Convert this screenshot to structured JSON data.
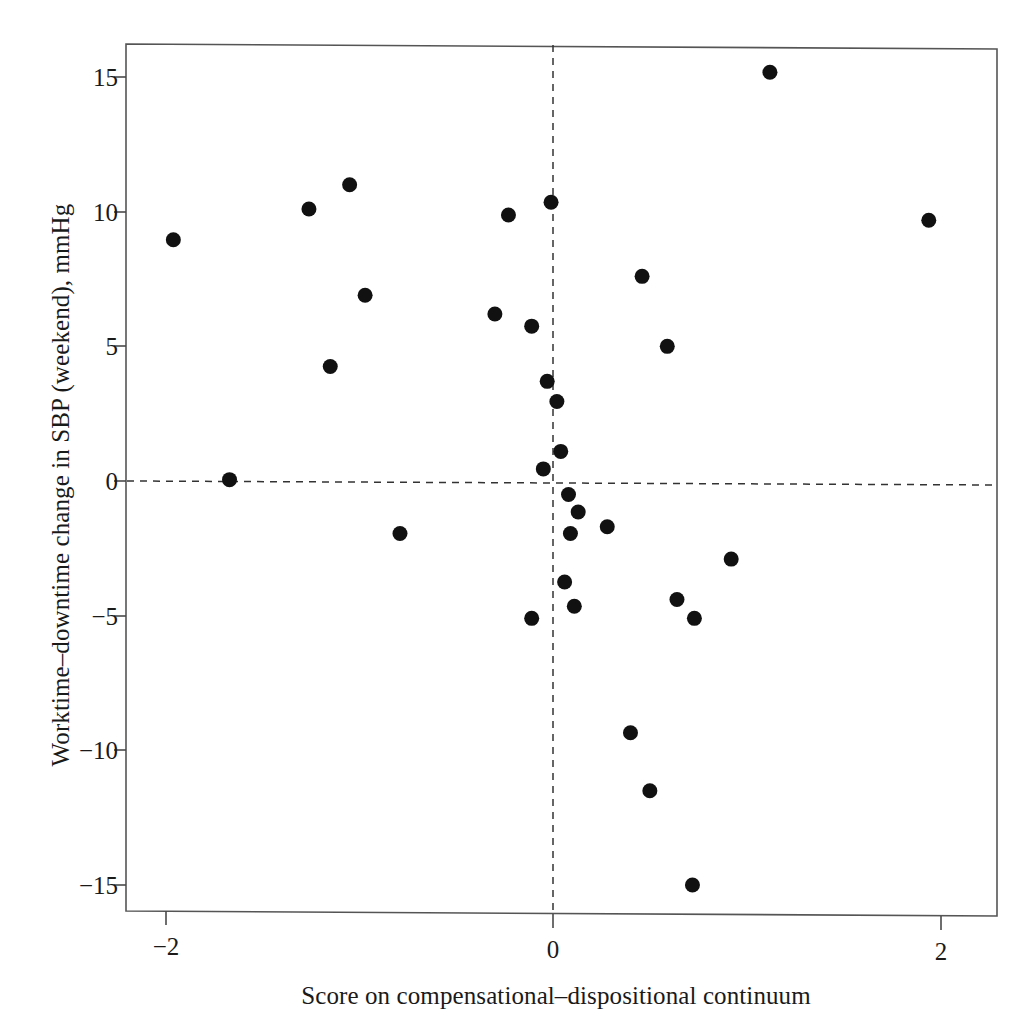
{
  "chart_data": {
    "type": "scatter",
    "title": "",
    "xlabel": "Score on compensational–dispositional continuum",
    "ylabel": "Worktime–downtime change in SBP (weekend), mmHg",
    "xlim": [
      -2.22,
      2.22
    ],
    "xticks": [
      -2,
      0,
      2
    ],
    "xticklabels": [
      "−2",
      "0",
      "2"
    ],
    "ylim": [
      -16.3,
      16.5
    ],
    "yticks": [
      15,
      10,
      5,
      0,
      -5,
      -10,
      -15
    ],
    "yticklabels": [
      "15",
      "10",
      "5",
      "0",
      "−5",
      "−10",
      "−15"
    ],
    "grid": false,
    "legend": null,
    "reference_lines": [
      {
        "name": "vertical-zero-line",
        "axis": "x",
        "value": 0,
        "style": "dashed"
      },
      {
        "name": "horizontal-zero-line",
        "axis": "y",
        "value": 0,
        "style": "dashed"
      }
    ],
    "marker": {
      "shape": "circle",
      "color": "#111111",
      "size_px": 15
    },
    "n_points": 34,
    "points": [
      {
        "x": -1.96,
        "y": 8.96
      },
      {
        "x": -1.67,
        "y": 0.05
      },
      {
        "x": -1.26,
        "y": 10.1
      },
      {
        "x": -1.15,
        "y": 4.25
      },
      {
        "x": -1.05,
        "y": 11.0
      },
      {
        "x": -0.97,
        "y": 6.9
      },
      {
        "x": -0.79,
        "y": -1.95
      },
      {
        "x": -0.3,
        "y": 6.2
      },
      {
        "x": -0.23,
        "y": 9.88
      },
      {
        "x": -0.11,
        "y": 5.75
      },
      {
        "x": -0.11,
        "y": -5.1
      },
      {
        "x": -0.05,
        "y": 0.45
      },
      {
        "x": -0.03,
        "y": 3.7
      },
      {
        "x": -0.01,
        "y": 10.35
      },
      {
        "x": 0.02,
        "y": 2.95
      },
      {
        "x": 0.04,
        "y": 1.1
      },
      {
        "x": 0.06,
        "y": -3.75
      },
      {
        "x": 0.08,
        "y": -0.5
      },
      {
        "x": 0.09,
        "y": -1.95
      },
      {
        "x": 0.13,
        "y": -1.15
      },
      {
        "x": 0.11,
        "y": -4.65
      },
      {
        "x": 0.28,
        "y": -1.7
      },
      {
        "x": 0.4,
        "y": -9.35
      },
      {
        "x": 0.46,
        "y": 7.6
      },
      {
        "x": 0.5,
        "y": -11.5
      },
      {
        "x": 0.59,
        "y": 5.0
      },
      {
        "x": 0.64,
        "y": -4.4
      },
      {
        "x": 0.72,
        "y": -15.0
      },
      {
        "x": 0.73,
        "y": -5.1
      },
      {
        "x": 0.92,
        "y": -2.9
      },
      {
        "x": 1.12,
        "y": 15.18
      },
      {
        "x": 1.94,
        "y": 9.68
      }
    ]
  },
  "axes": {
    "y_tick_labels": [
      "15",
      "10",
      "5",
      "0",
      "−5",
      "−10",
      "−15"
    ],
    "x_tick_labels": [
      "−2",
      "0",
      "2"
    ]
  },
  "labels": {
    "x_axis_title": "Score on compensational–dispositional continuum",
    "y_axis_title": "Worktime–downtime change in SBP (weekend), mmHg"
  },
  "colors": {
    "marker": "#111111",
    "axis": "#4a4a4a",
    "reference_line": "#333333",
    "background": "#ffffff"
  }
}
